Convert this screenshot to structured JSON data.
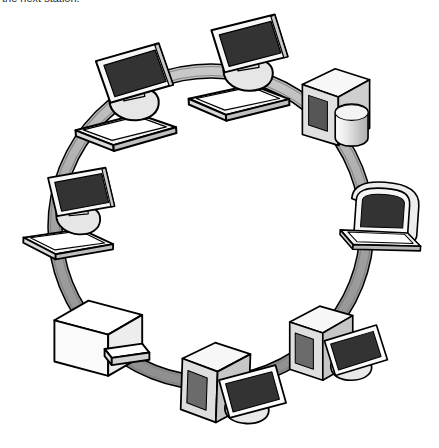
{
  "caption": {
    "text": "the next station."
  },
  "diagram": {
    "type": "ring-topology",
    "colors": {
      "background": "#ffffff",
      "outline": "#000000",
      "ring_fill": "#a6a6a6",
      "ring_fill_light": "#c9c9c9",
      "ring_edge": "#6e6e6e",
      "screen": "#333333",
      "device_light": "#ffffff",
      "device_mid": "#d9d9d9",
      "device_shade": "#b3b3b3",
      "device_dark": "#6b6b6b",
      "panel_dark": "#565656"
    },
    "ring": {
      "center_x": 211,
      "center_y": 227,
      "radius": 156,
      "band_width": 13
    },
    "nodes": [
      {
        "id": "node-1",
        "label": "Workstation (top)",
        "device": "desktop-monitor-keyboard",
        "angle_deg": 275,
        "x": 228,
        "y": 70
      },
      {
        "id": "node-2",
        "label": "Server with disk (upper right)",
        "device": "server-tower-disk",
        "angle_deg": 324,
        "x": 330,
        "y": 108
      },
      {
        "id": "node-3",
        "label": "Laptop (right)",
        "device": "laptop",
        "angle_deg": 8,
        "x": 383,
        "y": 213
      },
      {
        "id": "node-4",
        "label": "Desktop PC (lower right)",
        "device": "tower-monitor",
        "angle_deg": 52,
        "x": 330,
        "y": 344
      },
      {
        "id": "node-5",
        "label": "Desktop PC (bottom)",
        "device": "tower-monitor",
        "angle_deg": 80,
        "x": 228,
        "y": 382
      },
      {
        "id": "node-6",
        "label": "Printer (lower left)",
        "device": "printer",
        "angle_deg": 130,
        "x": 98,
        "y": 334
      },
      {
        "id": "node-7",
        "label": "Workstation (left)",
        "device": "desktop-monitor-keyboard",
        "angle_deg": 190,
        "x": 68,
        "y": 208
      },
      {
        "id": "node-8",
        "label": "Workstation (upper left)",
        "device": "desktop-monitor-keyboard",
        "angle_deg": 228,
        "x": 110,
        "y": 100
      }
    ]
  }
}
